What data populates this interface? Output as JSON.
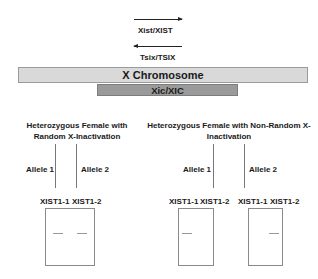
{
  "genes": {
    "xist": {
      "label": "Xist/XIST",
      "direction": "right"
    },
    "tsix": {
      "label": "Tsix/TSIX",
      "direction": "left"
    }
  },
  "chromosome": {
    "label": "X Chromosome",
    "fill": "#d9d9d9"
  },
  "xic": {
    "label": "Xic/XIC",
    "fill": "#9a9a9a"
  },
  "panels": [
    {
      "title_line1": "Heterozygous Female with",
      "title_line2": "Random X-Inactivation",
      "allele1": "Allele 1",
      "allele2": "Allele 2",
      "gels": [
        {
          "lane1": "XIST1-1",
          "lane2": "XIST1-2",
          "bands": [
            "lane1",
            "lane2"
          ]
        }
      ]
    },
    {
      "title_line1": "Heterozygous Female with Non-Random X-",
      "title_line2": "Inactivation",
      "allele1": "Allele 1",
      "allele2": "Allele 2",
      "gels": [
        {
          "lane1": "XIST1-1",
          "lane2": "XIST1-2",
          "bands": [
            "lane1"
          ]
        },
        {
          "lane1": "XIST1-1",
          "lane2": "XIST1-2",
          "bands": [
            "lane2"
          ]
        }
      ]
    }
  ]
}
